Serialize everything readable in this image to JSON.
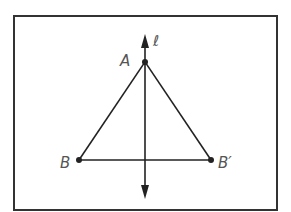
{
  "diagram": {
    "line_label": "ℓ",
    "points": [
      {
        "id": "A",
        "label": "A",
        "x": 0,
        "y": 3
      },
      {
        "id": "B",
        "label": "B",
        "x": -2,
        "y": 0
      },
      {
        "id": "B_prime",
        "label": "B′",
        "x": 2,
        "y": 0
      }
    ],
    "segments": [
      [
        "A",
        "B"
      ],
      [
        "A",
        "B_prime"
      ],
      [
        "B",
        "B_prime"
      ]
    ],
    "colors": {
      "stroke": "#222222",
      "frame": "#333333",
      "label": "#555555"
    }
  }
}
